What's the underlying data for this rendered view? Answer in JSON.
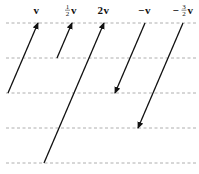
{
  "diagram": {
    "gridlines_y": [
      23,
      58,
      93,
      128,
      163
    ],
    "grid_color": "#9a9a9a",
    "vector_color": "#111111",
    "labels": [
      {
        "id": "v",
        "prefix": "",
        "numerator": "",
        "denominator": "",
        "text": "v",
        "x": 37,
        "y": 14
      },
      {
        "id": "half-v",
        "prefix": "",
        "numerator": "1",
        "denominator": "2",
        "text": "v",
        "x": 71,
        "y": 14
      },
      {
        "id": "two-v",
        "prefix": "2",
        "numerator": "",
        "denominator": "",
        "text": "v",
        "x": 104,
        "y": 14
      },
      {
        "id": "neg-v",
        "prefix": "−",
        "numerator": "",
        "denominator": "",
        "text": "v",
        "x": 145,
        "y": 14
      },
      {
        "id": "neg-three-halves-v",
        "prefix": "−",
        "numerator": "3",
        "denominator": "2",
        "text": "v",
        "x": 183,
        "y": 14
      }
    ],
    "vectors": [
      {
        "id": "v",
        "label": "v",
        "scalar": 1,
        "from": [
          8,
          93
        ],
        "to": [
          38,
          23
        ]
      },
      {
        "id": "half-v",
        "label": "1/2 v",
        "scalar": 0.5,
        "from": [
          57,
          58
        ],
        "to": [
          72,
          23
        ]
      },
      {
        "id": "two-v",
        "label": "2v",
        "scalar": 2,
        "from": [
          44,
          163
        ],
        "to": [
          104,
          23
        ]
      },
      {
        "id": "neg-v",
        "label": "−v",
        "scalar": -1,
        "from": [
          145,
          23
        ],
        "to": [
          115,
          93
        ]
      },
      {
        "id": "neg-three-halves-v",
        "label": "−3/2 v",
        "scalar": -1.5,
        "from": [
          183,
          23
        ],
        "to": [
          138,
          128
        ]
      }
    ]
  }
}
